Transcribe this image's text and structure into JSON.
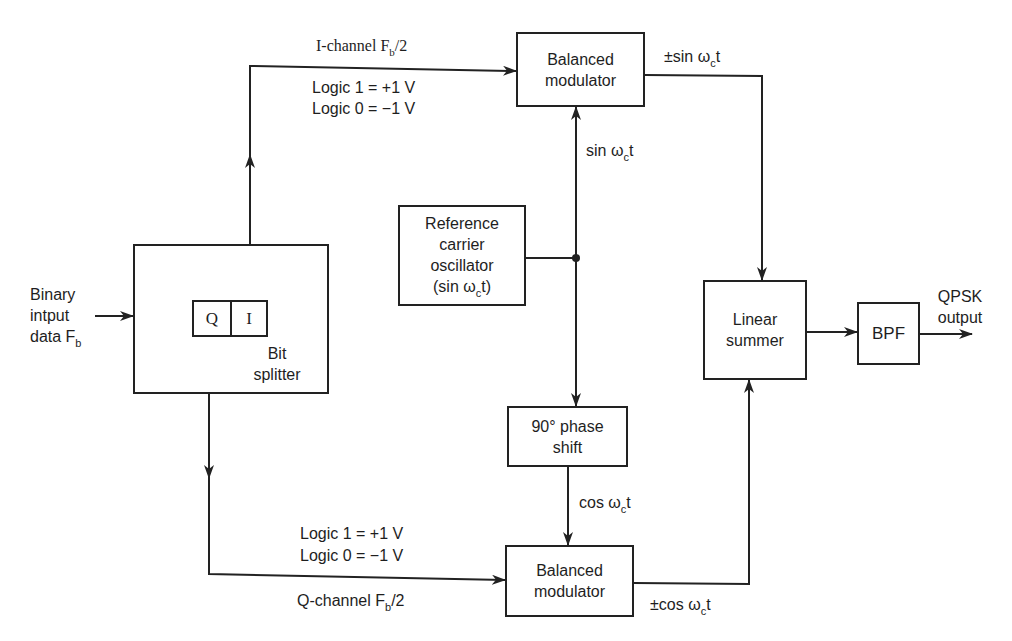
{
  "diagram": {
    "type": "QPSK transmitter block diagram",
    "colors": {
      "line": "#222222",
      "text": "#1e1e1e",
      "background": "#ffffff"
    },
    "input": {
      "line1": "Binary",
      "line2": "intput",
      "line3_main": "data F",
      "line3_sub": "b"
    },
    "bit_splitter": {
      "cell_q": "Q",
      "cell_i": "I",
      "label1": "Bit",
      "label2": "splitter"
    },
    "i_channel": {
      "name_main": "I-channel F",
      "name_sub": "b",
      "name_tail": "/2",
      "logic1": "Logic 1 = +1 V",
      "logic0": "Logic 0 = −1 V"
    },
    "q_channel": {
      "name_main": "Q-channel F",
      "name_sub": "b",
      "name_tail": "/2",
      "logic1": "Logic 1 = +1 V",
      "logic0": "Logic 0 = −1 V"
    },
    "top_modulator": {
      "line1": "Balanced",
      "line2": "modulator"
    },
    "bottom_modulator": {
      "line1": "Balanced",
      "line2": "modulator"
    },
    "oscillator": {
      "line1": "Reference",
      "line2": "carrier",
      "line3": "oscillator",
      "line4_main": "(sin ω",
      "line4_sub": "c",
      "line4_tail": "t)"
    },
    "phase_shift": {
      "line1": "90° phase",
      "line2": "shift"
    },
    "summer": {
      "line1": "Linear",
      "line2": "summer"
    },
    "bpf": {
      "label": "BPF"
    },
    "output": {
      "line1": "QPSK",
      "line2": "output"
    },
    "signals": {
      "sin_carrier": {
        "main": "sin ω",
        "sub": "c",
        "tail": "t"
      },
      "cos_carrier": {
        "main": "cos ω",
        "sub": "c",
        "tail": "t"
      },
      "top_mod_out": {
        "main": "±sin ω",
        "sub": "c",
        "tail": "t"
      },
      "bottom_mod_out": {
        "main": "±cos ω",
        "sub": "c",
        "tail": "t"
      }
    }
  }
}
